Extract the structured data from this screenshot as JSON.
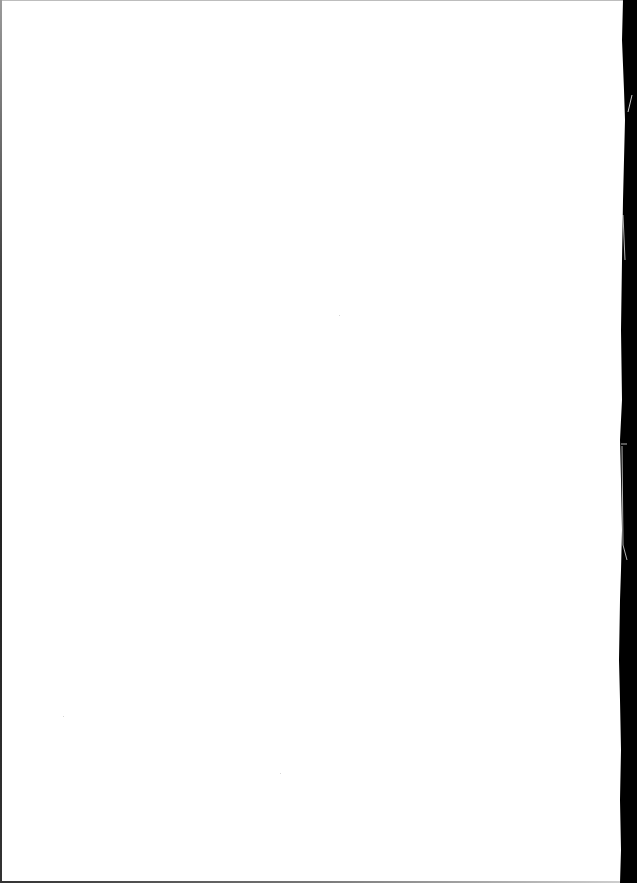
{
  "page": {
    "type": "scanned-page",
    "content": "blank",
    "text_lines": []
  },
  "colors": {
    "paper": "#ffffff",
    "scan_edge": "#000000",
    "border": "#bdbdbd"
  }
}
